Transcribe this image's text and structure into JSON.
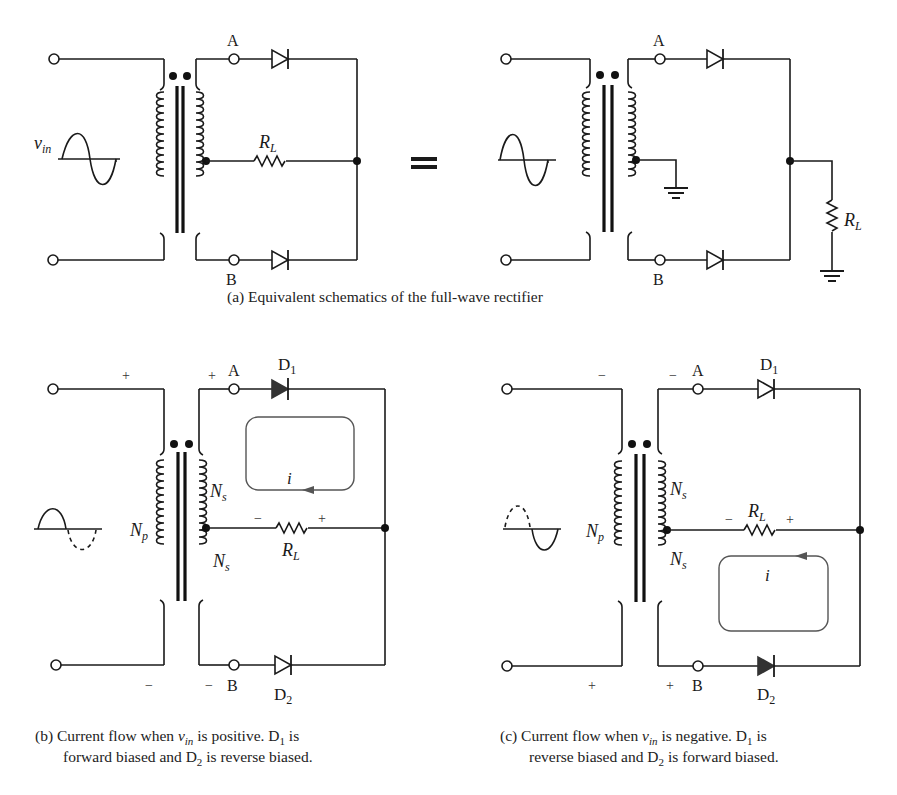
{
  "figure": {
    "panel_a": {
      "caption": "(a) Equivalent schematics of the full-wave rectifier",
      "left": {
        "source_label": "v",
        "source_sub": "in",
        "terminal_a": "A",
        "terminal_b": "B",
        "load_label": "R",
        "load_sub": "L"
      },
      "equals_sign": "=",
      "right": {
        "terminal_a": "A",
        "terminal_b": "B",
        "load_label": "R",
        "load_sub": "L"
      }
    },
    "panel_b": {
      "caption_line1_pre": "(b) Current flow when ",
      "caption_v": "v",
      "caption_v_sub": "in",
      "caption_line1_mid": " is positive. D",
      "caption_d1_sub": "1",
      "caption_line1_post": " is",
      "caption_line2_pre": "forward biased and D",
      "caption_d2_sub": "2",
      "caption_line2_post": " is reverse biased.",
      "primary_label": "N",
      "primary_sub": "p",
      "secondary_label": "N",
      "secondary_sub": "s",
      "terminal_a": "A",
      "terminal_b": "B",
      "diode1": "D",
      "diode1_sub": "1",
      "diode2": "D",
      "diode2_sub": "2",
      "load_label": "R",
      "load_sub": "L",
      "current_label": "i",
      "sign_primary_top": "+",
      "sign_primary_bottom": "−",
      "sign_secondary_top": "+",
      "sign_secondary_bottom": "−",
      "sign_load_left": "−",
      "sign_load_right": "+"
    },
    "panel_c": {
      "caption_line1_pre": "(c) Current flow when ",
      "caption_v": "v",
      "caption_v_sub": "in",
      "caption_line1_mid": " is negative. D",
      "caption_d1_sub": "1",
      "caption_line1_post": " is",
      "caption_line2_pre": "reverse biased and D",
      "caption_d2_sub": "2",
      "caption_line2_post": " is forward biased.",
      "primary_label": "N",
      "primary_sub": "p",
      "secondary_label": "N",
      "secondary_sub": "s",
      "terminal_a": "A",
      "terminal_b": "B",
      "diode1": "D",
      "diode1_sub": "1",
      "diode2": "D",
      "diode2_sub": "2",
      "load_label": "R",
      "load_sub": "L",
      "current_label": "i",
      "sign_primary_top": "−",
      "sign_primary_bottom": "+",
      "sign_secondary_top": "−",
      "sign_secondary_bottom": "+",
      "sign_load_left": "−",
      "sign_load_right": "+"
    },
    "colors": {
      "ink": "#1a1a1a",
      "loop": "#555555",
      "background": "#ffffff"
    }
  }
}
